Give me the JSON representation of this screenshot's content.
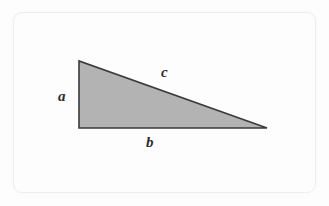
{
  "figure": {
    "name": "right-triangle-diagram",
    "background_color": "#fdfdfd",
    "frame": {
      "border_color": "#eeeeee",
      "corner_radius": 9,
      "x": 13,
      "y": 12,
      "width": 303,
      "height": 181
    },
    "shape": {
      "type": "right-triangle",
      "fill_color": "#b3b3b3",
      "stroke_color": "#3a3a3a",
      "stroke_width": 1.6,
      "points": "79,61 79,128 267,128",
      "vertices": [
        {
          "name": "apex-top-left",
          "x": 79,
          "y": 61
        },
        {
          "name": "right-angle-bottom-left",
          "x": 79,
          "y": 128
        },
        {
          "name": "bottom-right",
          "x": 267,
          "y": 128
        }
      ]
    },
    "labels": {
      "a": "a",
      "b": "b",
      "c": "c"
    },
    "label_meta": {
      "a": {
        "side": "vertical-leg",
        "x": 58,
        "y": 89
      },
      "b": {
        "side": "horizontal-leg",
        "x": 146,
        "y": 135
      },
      "c": {
        "side": "hypotenuse",
        "x": 161,
        "y": 65
      }
    },
    "label_color": "#2b2b2b"
  }
}
